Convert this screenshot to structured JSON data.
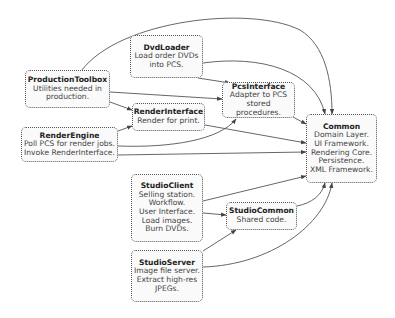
{
  "diagram": {
    "nodes": {
      "dvdloader": {
        "title": "DvdLoader",
        "lines": [
          "Load order DVDs",
          "into PCS."
        ]
      },
      "productiontoolbox": {
        "title": "ProductionToolbox",
        "lines": [
          "Utilities needed in",
          "production."
        ]
      },
      "renderinterface": {
        "title": "RenderInterface",
        "lines": [
          "Render for print."
        ]
      },
      "pcsinterface": {
        "title": "PcsInterface",
        "lines": [
          "Adapter to PCS",
          "stored procedures."
        ]
      },
      "renderengine": {
        "title": "RenderEngine",
        "lines": [
          "Poll PCS for render jobs.",
          "Invoke RenderInterface."
        ]
      },
      "common": {
        "title": "Common",
        "lines": [
          "Domain Layer.",
          "UI Framework.",
          "Rendering Core.",
          "Persistence.",
          "XML Framework."
        ]
      },
      "studioclient": {
        "title": "StudioClient",
        "lines": [
          "Selling station.",
          "Workflow.",
          "User Interface.",
          "Load images.",
          "Burn DVDs."
        ]
      },
      "studiocommon": {
        "title": "StudioCommon",
        "lines": [
          "Shared code."
        ]
      },
      "studioserver": {
        "title": "StudioServer",
        "lines": [
          "Image file server.",
          "Extract high-res",
          "JPEGs."
        ]
      }
    },
    "edges": [
      {
        "from": "ProductionToolbox",
        "to": "Common"
      },
      {
        "from": "DvdLoader",
        "to": "Common"
      },
      {
        "from": "DvdLoader",
        "to": "PcsInterface"
      },
      {
        "from": "ProductionToolbox",
        "to": "PcsInterface"
      },
      {
        "from": "ProductionToolbox",
        "to": "RenderInterface"
      },
      {
        "from": "RenderEngine",
        "to": "RenderInterface"
      },
      {
        "from": "RenderEngine",
        "to": "PcsInterface"
      },
      {
        "from": "RenderEngine",
        "to": "Common"
      },
      {
        "from": "RenderInterface",
        "to": "Common"
      },
      {
        "from": "PcsInterface",
        "to": "Common"
      },
      {
        "from": "StudioClient",
        "to": "Common"
      },
      {
        "from": "StudioClient",
        "to": "StudioCommon"
      },
      {
        "from": "StudioServer",
        "to": "StudioCommon"
      },
      {
        "from": "StudioCommon",
        "to": "Common"
      },
      {
        "from": "StudioServer",
        "to": "Common"
      }
    ]
  }
}
